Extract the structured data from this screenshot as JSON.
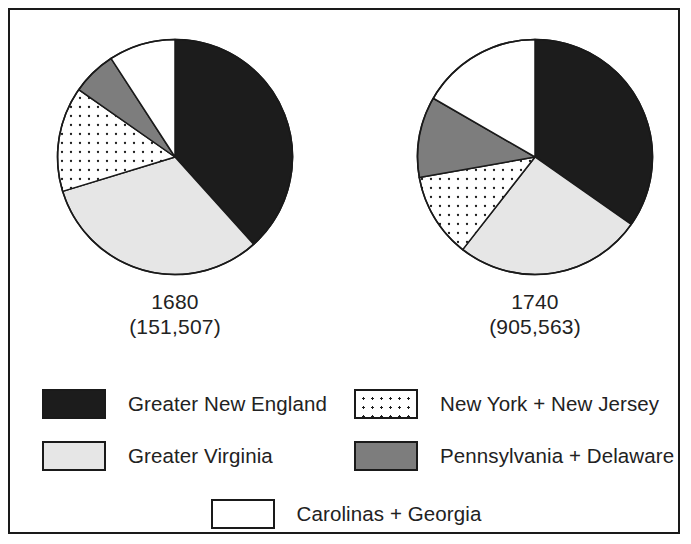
{
  "figure": {
    "background_color": "#ffffff",
    "border_color": "#1a1a1a"
  },
  "charts": [
    {
      "id": "1680",
      "year_label": "1680",
      "total_label": "(151,507)",
      "total_value": 151507
    },
    {
      "id": "1740",
      "year_label": "1740",
      "total_label": "(905,563)",
      "total_value": 905563
    }
  ],
  "legend": {
    "entries": [
      {
        "label": "Greater New England",
        "swatch": "solid-black",
        "color": "#1c1c1c"
      },
      {
        "label": "New York + New Jersey",
        "swatch": "dotted",
        "color": "#ffffff"
      },
      {
        "label": "Greater Virginia",
        "swatch": "solid-light-gray",
        "color": "#e6e6e6"
      },
      {
        "label": "Pennsylvania + Delaware",
        "swatch": "solid-dark-gray",
        "color": "#7d7d7d"
      },
      {
        "label": "Carolinas + Georgia",
        "swatch": "solid-white",
        "color": "#ffffff"
      }
    ]
  },
  "chart_data": {
    "type": "pie",
    "title": "",
    "subtitle": "",
    "xlabel": "",
    "ylabel": "",
    "grid": false,
    "legend_position": "bottom",
    "units": "percent of colonial population",
    "categories": [
      "Greater New England",
      "Greater Virginia",
      "New York + New Jersey",
      "Pennsylvania + Delaware",
      "Carolinas + Georgia"
    ],
    "slice_colors": [
      "#1c1c1c",
      "#e6e6e6",
      "#ffffff",
      "#7d7d7d",
      "#ffffff"
    ],
    "slice_patterns": [
      "solid",
      "solid",
      "dotted",
      "solid",
      "solid"
    ],
    "start_angle_deg": 0,
    "direction": "clockwise",
    "series": [
      {
        "name": "1680",
        "total": 151507,
        "total_label": "(151,507)",
        "values": [
          38.3,
          32.0,
          14.4,
          6.1,
          9.2
        ],
        "angles_deg": [
          138,
          115,
          52,
          22,
          33
        ]
      },
      {
        "name": "1740",
        "total": 905563,
        "total_label": "(905,563)",
        "values": [
          34.7,
          25.8,
          11.7,
          11.1,
          16.7
        ],
        "angles_deg": [
          125,
          93,
          42,
          40,
          60
        ]
      }
    ]
  }
}
